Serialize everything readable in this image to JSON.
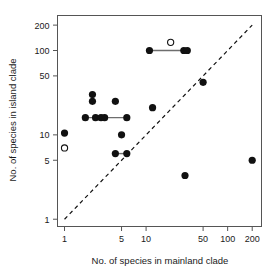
{
  "chart_data": {
    "type": "scatter",
    "title": "",
    "xlabel": "No. of species in mainland clade",
    "ylabel": "No. of species in island clade",
    "xscale": "log",
    "yscale": "log",
    "xlim": [
      0.82,
      260
    ],
    "ylim": [
      0.82,
      260
    ],
    "grid": false,
    "legend": null,
    "xticks": [
      1,
      5,
      10,
      50,
      100,
      200
    ],
    "xticklabels": [
      "1",
      "5",
      "10",
      "50",
      "100",
      "200"
    ],
    "yticks": [
      1,
      5,
      10,
      50,
      100,
      200
    ],
    "yticklabels": [
      "1",
      "5",
      "10",
      "50",
      "100",
      "200"
    ],
    "series": [
      {
        "name": "filled-points",
        "marker": "filled-circle",
        "points": [
          {
            "x": 1,
            "y": 10.5
          },
          {
            "x": 1.8,
            "y": 16
          },
          {
            "x": 2.2,
            "y": 30
          },
          {
            "x": 2.2,
            "y": 25
          },
          {
            "x": 2.4,
            "y": 16
          },
          {
            "x": 2.8,
            "y": 16
          },
          {
            "x": 3.1,
            "y": 16
          },
          {
            "x": 4.2,
            "y": 25
          },
          {
            "x": 4.2,
            "y": 6
          },
          {
            "x": 5,
            "y": 10
          },
          {
            "x": 5.8,
            "y": 16
          },
          {
            "x": 5.8,
            "y": 6
          },
          {
            "x": 11,
            "y": 100
          },
          {
            "x": 12,
            "y": 21
          },
          {
            "x": 29,
            "y": 100
          },
          {
            "x": 32,
            "y": 100
          },
          {
            "x": 30,
            "y": 3.3
          },
          {
            "x": 50,
            "y": 42
          },
          {
            "x": 200,
            "y": 5
          }
        ]
      },
      {
        "name": "open-points",
        "marker": "open-circle",
        "points": [
          {
            "x": 1,
            "y": 7
          },
          {
            "x": 20,
            "y": 125
          }
        ]
      }
    ],
    "connector_segments": [
      {
        "x1": 1.8,
        "y1": 16,
        "x2": 5.8,
        "y2": 16
      },
      {
        "x1": 4.2,
        "y1": 6,
        "x2": 5.8,
        "y2": 6
      },
      {
        "x1": 11,
        "y1": 100,
        "x2": 32,
        "y2": 100
      }
    ],
    "reference_line": {
      "style": "dashed",
      "description": "1:1 diagonal",
      "x1": 1,
      "y1": 1,
      "x2": 200,
      "y2": 200
    }
  }
}
